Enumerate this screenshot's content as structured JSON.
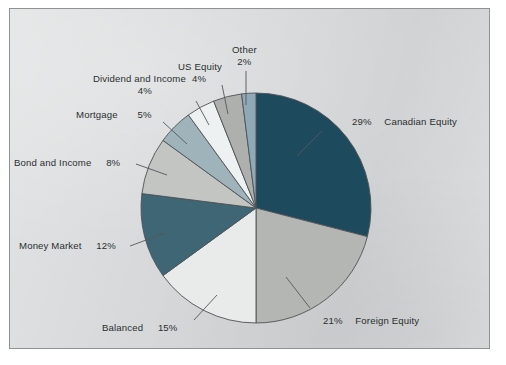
{
  "figure": {
    "background_color": "#d6d8d9",
    "border_color": "#8e9295",
    "text_color": "#2b2f31",
    "slice_outline_color": "#4d5154",
    "leader_line_color": "#53585b"
  },
  "chart_data": {
    "type": "pie",
    "title": "",
    "subtitle": "",
    "xlabel": "",
    "ylabel": "",
    "legend_position": "none",
    "grid": false,
    "start_angle_deg": 0,
    "direction": "clockwise",
    "units": "percent",
    "total": 100,
    "categories": [
      "Canadian Equity",
      "Foreign Equity",
      "Balanced",
      "Money Market",
      "Bond and Income",
      "Mortgage",
      "Dividend and Income",
      "US Equity",
      "Other"
    ],
    "values": [
      29,
      21,
      15,
      12,
      8,
      5,
      4,
      4,
      2
    ],
    "value_labels": [
      "29%",
      "21%",
      "15%",
      "12%",
      "8%",
      "5%",
      "4%",
      "4%",
      "2%"
    ],
    "colors": [
      "#1d4a5c",
      "#b4b6b4",
      "#e9eaea",
      "#3e6674",
      "#c3c5c3",
      "#9fb3ba",
      "#eef1f2",
      "#aeb0ae",
      "#90a9b6"
    ],
    "slices": [
      {
        "label": "Canadian Equity",
        "value": 29,
        "value_label": "29%",
        "color": "#1d4a5c"
      },
      {
        "label": "Foreign Equity",
        "value": 21,
        "value_label": "21%",
        "color": "#b4b6b4"
      },
      {
        "label": "Balanced",
        "value": 15,
        "value_label": "15%",
        "color": "#e9eaea"
      },
      {
        "label": "Money Market",
        "value": 12,
        "value_label": "12%",
        "color": "#3e6674"
      },
      {
        "label": "Bond and Income",
        "value": 8,
        "value_label": "8%",
        "color": "#c3c5c3"
      },
      {
        "label": "Mortgage",
        "value": 5,
        "value_label": "5%",
        "color": "#9fb3ba"
      },
      {
        "label": "Dividend and Income",
        "value": 4,
        "value_label": "4%",
        "color": "#eef1f2"
      },
      {
        "label": "US Equity",
        "value": 4,
        "value_label": "4%",
        "color": "#aeb0ae"
      },
      {
        "label": "Other",
        "value": 2,
        "value_label": "2%",
        "color": "#90a9b6"
      }
    ]
  },
  "labels": {
    "canadian_equity": {
      "name": "Canadian Equity",
      "pct": "29%"
    },
    "foreign_equity": {
      "name": "Foreign Equity",
      "pct": "21%"
    },
    "balanced": {
      "name": "Balanced",
      "pct": "15%"
    },
    "money_market": {
      "name": "Money Market",
      "pct": "12%"
    },
    "bond_income": {
      "name": "Bond and Income",
      "pct": "8%"
    },
    "mortgage": {
      "name": "Mortgage",
      "pct": "5%"
    },
    "dividend_income": {
      "name": "Dividend and Income",
      "pct": "4%"
    },
    "us_equity": {
      "name": "US Equity",
      "pct": "4%"
    },
    "other": {
      "name": "Other",
      "pct": "2%"
    }
  }
}
